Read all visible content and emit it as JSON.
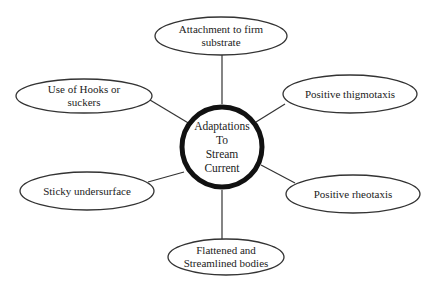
{
  "diagram": {
    "type": "mind-map",
    "center": {
      "label_lines": [
        "Adaptations",
        "To",
        "Stream",
        "Current"
      ],
      "label": "Adaptations To Stream Current"
    },
    "nodes": [
      {
        "id": "attachment",
        "label_lines": [
          "Attachment to firm",
          "substrate"
        ],
        "position": "top"
      },
      {
        "id": "thigmotaxis",
        "label_lines": [
          "Positive thigmotaxis"
        ],
        "position": "upper-right"
      },
      {
        "id": "rheotaxis",
        "label_lines": [
          "Positive rheotaxis"
        ],
        "position": "lower-right"
      },
      {
        "id": "flattened",
        "label_lines": [
          "Flattened and",
          "Streamlined bodies"
        ],
        "position": "bottom"
      },
      {
        "id": "sticky",
        "label_lines": [
          "Sticky undersurface"
        ],
        "position": "lower-left"
      },
      {
        "id": "hooks",
        "label_lines": [
          "Use of Hooks or",
          "suckers"
        ],
        "position": "upper-left"
      }
    ],
    "colors": {
      "stroke": "#222222",
      "background": "#ffffff",
      "text": "#222222"
    }
  }
}
